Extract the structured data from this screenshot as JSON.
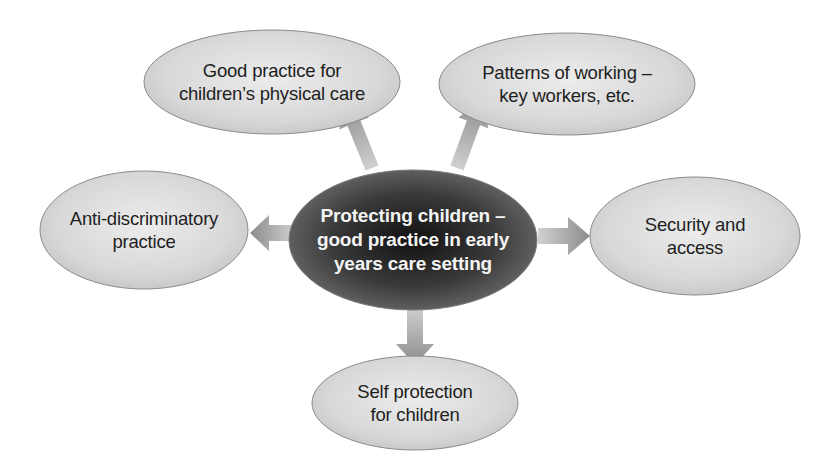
{
  "diagram": {
    "type": "spider-diagram",
    "colors": {
      "background": "#ffffff",
      "outer_node_fill": "#d9d9d9",
      "outer_node_stroke": "#8a8a8a",
      "center_node_fill": "#3a3a3a",
      "center_text": "#f4f4f4",
      "outer_text": "#1e1e1e",
      "arrow": "#9a9a9a"
    },
    "center": {
      "lines": [
        "Protecting children –",
        "good practice in early",
        "years care setting"
      ]
    },
    "nodes": [
      {
        "id": "physical-care",
        "lines": [
          "Good practice for",
          "children’s physical care"
        ]
      },
      {
        "id": "patterns-of-working",
        "lines": [
          "Patterns of working –",
          "key workers, etc."
        ]
      },
      {
        "id": "anti-discriminatory",
        "lines": [
          "Anti-discriminatory",
          "practice"
        ]
      },
      {
        "id": "security-access",
        "lines": [
          "Security and",
          "access"
        ]
      },
      {
        "id": "self-protection",
        "lines": [
          "Self protection",
          "for children"
        ]
      }
    ],
    "edges": [
      {
        "from": "center",
        "to": "physical-care",
        "direction": "up-left"
      },
      {
        "from": "center",
        "to": "patterns-of-working",
        "direction": "up-right"
      },
      {
        "from": "center",
        "to": "anti-discriminatory",
        "direction": "left"
      },
      {
        "from": "center",
        "to": "security-access",
        "direction": "right"
      },
      {
        "from": "center",
        "to": "self-protection",
        "direction": "down"
      }
    ]
  }
}
